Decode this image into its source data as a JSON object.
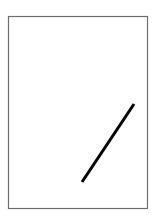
{
  "canvas": {
    "width": 161,
    "height": 217,
    "background": "#ffffff"
  },
  "frame": {
    "x": 8.5,
    "y": 16.5,
    "width": 139,
    "height": 192,
    "stroke": "#6e6e6e",
    "stroke_width": 1.2
  },
  "line": {
    "x1": 134,
    "y1": 104,
    "x2": 82,
    "y2": 182,
    "stroke": "#000000",
    "stroke_width": 3
  }
}
